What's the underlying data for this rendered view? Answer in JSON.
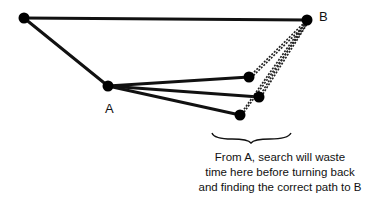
{
  "diagram": {
    "nodes": [
      {
        "id": "start",
        "x": 24,
        "y": 18,
        "label": ""
      },
      {
        "id": "B",
        "x": 307,
        "y": 20,
        "label": "B"
      },
      {
        "id": "A",
        "x": 108,
        "y": 86,
        "label": "A"
      },
      {
        "id": "n1",
        "x": 249,
        "y": 77,
        "label": ""
      },
      {
        "id": "n2",
        "x": 259,
        "y": 97,
        "label": ""
      },
      {
        "id": "n3",
        "x": 240,
        "y": 115,
        "label": ""
      }
    ],
    "edges": [
      {
        "from": "start",
        "to": "B",
        "style": "solid"
      },
      {
        "from": "start",
        "to": "A",
        "style": "solid"
      },
      {
        "from": "A",
        "to": "n1",
        "style": "solid"
      },
      {
        "from": "A",
        "to": "n2",
        "style": "solid"
      },
      {
        "from": "A",
        "to": "n3",
        "style": "solid"
      },
      {
        "from": "n1",
        "to": "B",
        "style": "dashed"
      },
      {
        "from": "n2",
        "to": "B",
        "style": "dashed"
      },
      {
        "from": "n3",
        "to": "B",
        "style": "dashed"
      }
    ],
    "label_A": "A",
    "label_B": "B",
    "caption_lines": [
      "From A, search will waste",
      "time here before turning back",
      "and finding the correct path to B"
    ],
    "colors": {
      "line": "#111111",
      "node": "#000000"
    }
  }
}
